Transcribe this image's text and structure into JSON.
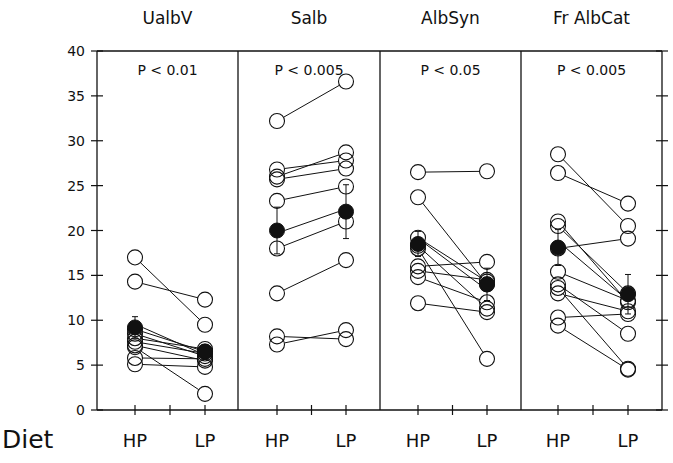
{
  "chart_data": [
    {
      "type": "scatter",
      "title": "UalbV",
      "annotation": "P < 0.01",
      "categories": [
        "HP",
        "LP"
      ],
      "xlabel": "Diet",
      "ylabel": "",
      "ylim": [
        0,
        40
      ],
      "yticks": [
        0,
        5,
        10,
        15,
        20,
        25,
        30,
        35,
        40
      ],
      "paired_lines": true,
      "subjects": [
        {
          "HP": 17.0,
          "LP": 9.5
        },
        {
          "HP": 14.3,
          "LP": 12.3
        },
        {
          "HP": 9.0,
          "LP": 6.5
        },
        {
          "HP": 8.5,
          "LP": 6.0
        },
        {
          "HP": 8.0,
          "LP": 6.8
        },
        {
          "HP": 7.6,
          "LP": 6.3
        },
        {
          "HP": 7.2,
          "LP": 5.5
        },
        {
          "HP": 5.8,
          "LP": 5.7
        },
        {
          "HP": 5.1,
          "LP": 4.8
        },
        {
          "HP": 7.0,
          "LP": 1.8
        }
      ],
      "mean": {
        "HP": 9.2,
        "LP": 6.5
      },
      "sem": {
        "HP": 1.2,
        "LP": 0.8
      }
    },
    {
      "type": "scatter",
      "title": "Salb",
      "annotation": "P < 0.005",
      "categories": [
        "HP",
        "LP"
      ],
      "ylim": [
        0,
        40
      ],
      "paired_lines": true,
      "subjects": [
        {
          "HP": 32.2,
          "LP": 36.6
        },
        {
          "HP": 26.8,
          "LP": 27.8
        },
        {
          "HP": 26.0,
          "LP": 28.7
        },
        {
          "HP": 25.7,
          "LP": 26.9
        },
        {
          "HP": 23.3,
          "LP": 24.9
        },
        {
          "HP": 18.0,
          "LP": 21.0
        },
        {
          "HP": 13.0,
          "LP": 16.7
        },
        {
          "HP": 8.2,
          "LP": 7.9
        },
        {
          "HP": 7.3,
          "LP": 8.9
        }
      ],
      "mean": {
        "HP": 20.0,
        "LP": 22.1
      },
      "sem": {
        "HP": 2.6,
        "LP": 3.0
      }
    },
    {
      "type": "scatter",
      "title": "AlbSyn",
      "annotation": "P < 0.05",
      "categories": [
        "HP",
        "LP"
      ],
      "ylim": [
        0,
        40
      ],
      "paired_lines": true,
      "subjects": [
        {
          "HP": 26.5,
          "LP": 26.6
        },
        {
          "HP": 23.7,
          "LP": 14.0
        },
        {
          "HP": 19.2,
          "LP": 14.3
        },
        {
          "HP": 18.3,
          "LP": 11.3
        },
        {
          "HP": 16.0,
          "LP": 16.5
        },
        {
          "HP": 15.5,
          "LP": 14.5
        },
        {
          "HP": 14.8,
          "LP": 12.0
        },
        {
          "HP": 11.9,
          "LP": 10.9
        },
        {
          "HP": 18.0,
          "LP": 5.7
        }
      ],
      "mean": {
        "HP": 18.5,
        "LP": 14.0
      },
      "sem": {
        "HP": 1.4,
        "LP": 1.8
      }
    },
    {
      "type": "scatter",
      "title": "Fr AlbCat",
      "annotation": "P < 0.005",
      "categories": [
        "HP",
        "LP"
      ],
      "ylim": [
        0,
        40
      ],
      "paired_lines": true,
      "subjects": [
        {
          "HP": 28.5,
          "LP": 20.5
        },
        {
          "HP": 26.4,
          "LP": 23.0
        },
        {
          "HP": 21.0,
          "LP": 12.0
        },
        {
          "HP": 20.5,
          "LP": 13.0
        },
        {
          "HP": 18.0,
          "LP": 19.1
        },
        {
          "HP": 15.4,
          "LP": 12.2
        },
        {
          "HP": 13.6,
          "LP": 4.6
        },
        {
          "HP": 13.0,
          "LP": 11.0
        },
        {
          "HP": 10.3,
          "LP": 10.7
        },
        {
          "HP": 9.4,
          "LP": 4.5
        },
        {
          "HP": 14.0,
          "LP": 8.5
        }
      ],
      "mean": {
        "HP": 18.1,
        "LP": 12.9
      },
      "sem": {
        "HP": 2.0,
        "LP": 2.2
      }
    }
  ],
  "axis": {
    "yticks": [
      "0",
      "5",
      "10",
      "15",
      "20",
      "25",
      "30",
      "35",
      "40"
    ],
    "xlabel": "Diet"
  },
  "colors": {
    "ink": "#111111",
    "background": "#ffffff",
    "mean_fill": "#111111"
  }
}
